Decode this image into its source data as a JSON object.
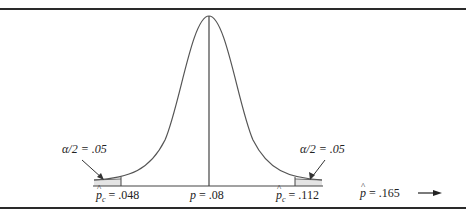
{
  "diagram": {
    "type": "normal-distribution-two-tailed-test",
    "center_label": {
      "symbol": "p",
      "value": ".08"
    },
    "left_critical": {
      "symbol": "p̂c",
      "value": ".048"
    },
    "right_critical": {
      "symbol": "p̂c",
      "value": ".112"
    },
    "observed": {
      "symbol": "p̂",
      "value": ".165",
      "arrow": "right-arrow"
    },
    "left_tail": {
      "label_symbol": "α/2",
      "value": ".05"
    },
    "right_tail": {
      "label_symbol": "α/2",
      "value": ".05"
    },
    "colors": {
      "line": "#555555",
      "shade": "#e4e4e4",
      "rule": "#2a2a2a"
    }
  },
  "labels": {
    "left_tail": "α/2 = .05",
    "right_tail": "α/2 = .05",
    "left_critical_value": " = .048",
    "center_value": " = .08",
    "right_critical_value": " = .112",
    "observed_value": " = .165"
  }
}
